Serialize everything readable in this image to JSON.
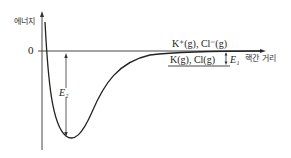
{
  "diagram": {
    "y_axis_label": "에너지",
    "x_axis_label": "핵간 거리",
    "zero_label": "0",
    "upper_level_label": "K⁺(g), Cl⁻(g)",
    "lower_level_label": "K(g), Cl(g)",
    "e1_label": "E₁",
    "e2_label": "E₂"
  }
}
